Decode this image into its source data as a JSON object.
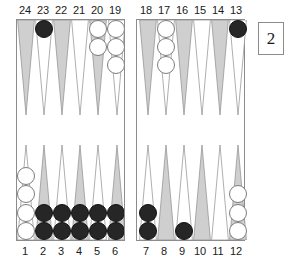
{
  "board": {
    "point_numbers_top": [
      "24",
      "23",
      "22",
      "21",
      "20",
      "19",
      "18",
      "17",
      "16",
      "15",
      "14",
      "13"
    ],
    "point_numbers_bottom": [
      "1",
      "2",
      "3",
      "4",
      "5",
      "6",
      "7",
      "8",
      "9",
      "10",
      "11",
      "12"
    ],
    "colors": {
      "point_dark": "#cfcfcf",
      "point_light": "#ffffff",
      "point_outline": "#8c8c8c",
      "checker_white": "#ffffff",
      "checker_black": "#262626",
      "board_border": "#8c8c8c",
      "label_text": "#1a1a1a",
      "background": "#ffffff"
    },
    "points": [
      {
        "number": "24",
        "half": "top",
        "column": 0,
        "shade": "dark",
        "checkers": 0,
        "checker_color": ""
      },
      {
        "number": "23",
        "half": "top",
        "column": 1,
        "shade": "light",
        "checkers": 1,
        "checker_color": "black"
      },
      {
        "number": "22",
        "half": "top",
        "column": 2,
        "shade": "dark",
        "checkers": 0,
        "checker_color": ""
      },
      {
        "number": "21",
        "half": "top",
        "column": 3,
        "shade": "light",
        "checkers": 0,
        "checker_color": ""
      },
      {
        "number": "20",
        "half": "top",
        "column": 4,
        "shade": "dark",
        "checkers": 2,
        "checker_color": "white"
      },
      {
        "number": "19",
        "half": "top",
        "column": 5,
        "shade": "light",
        "checkers": 3,
        "checker_color": "white"
      },
      {
        "number": "18",
        "half": "top",
        "column": 6,
        "shade": "dark",
        "checkers": 0,
        "checker_color": ""
      },
      {
        "number": "17",
        "half": "top",
        "column": 7,
        "shade": "light",
        "checkers": 3,
        "checker_color": "white"
      },
      {
        "number": "16",
        "half": "top",
        "column": 8,
        "shade": "dark",
        "checkers": 0,
        "checker_color": ""
      },
      {
        "number": "15",
        "half": "top",
        "column": 9,
        "shade": "light",
        "checkers": 0,
        "checker_color": ""
      },
      {
        "number": "14",
        "half": "top",
        "column": 10,
        "shade": "dark",
        "checkers": 0,
        "checker_color": ""
      },
      {
        "number": "13",
        "half": "top",
        "column": 11,
        "shade": "light",
        "checkers": 1,
        "checker_color": "black"
      },
      {
        "number": "1",
        "half": "bottom",
        "column": 0,
        "shade": "light",
        "checkers": 4,
        "checker_color": "white"
      },
      {
        "number": "2",
        "half": "bottom",
        "column": 1,
        "shade": "dark",
        "checkers": 2,
        "checker_color": "black"
      },
      {
        "number": "3",
        "half": "bottom",
        "column": 2,
        "shade": "light",
        "checkers": 2,
        "checker_color": "black"
      },
      {
        "number": "4",
        "half": "bottom",
        "column": 3,
        "shade": "dark",
        "checkers": 2,
        "checker_color": "black"
      },
      {
        "number": "5",
        "half": "bottom",
        "column": 4,
        "shade": "light",
        "checkers": 2,
        "checker_color": "black"
      },
      {
        "number": "6",
        "half": "bottom",
        "column": 5,
        "shade": "dark",
        "checkers": 2,
        "checker_color": "black"
      },
      {
        "number": "7",
        "half": "bottom",
        "column": 6,
        "shade": "light",
        "checkers": 2,
        "checker_color": "black"
      },
      {
        "number": "8",
        "half": "bottom",
        "column": 7,
        "shade": "dark",
        "checkers": 0,
        "checker_color": ""
      },
      {
        "number": "9",
        "half": "bottom",
        "column": 8,
        "shade": "light",
        "checkers": 1,
        "checker_color": "black"
      },
      {
        "number": "10",
        "half": "bottom",
        "column": 9,
        "shade": "dark",
        "checkers": 0,
        "checker_color": ""
      },
      {
        "number": "11",
        "half": "bottom",
        "column": 10,
        "shade": "light",
        "checkers": 0,
        "checker_color": ""
      },
      {
        "number": "12",
        "half": "bottom",
        "column": 11,
        "shade": "dark",
        "checkers": 3,
        "checker_color": "white"
      }
    ],
    "doubling_cube": {
      "value": "2",
      "position": "top-right"
    },
    "bar": {
      "white_checkers": 0,
      "black_checkers": 0
    }
  }
}
